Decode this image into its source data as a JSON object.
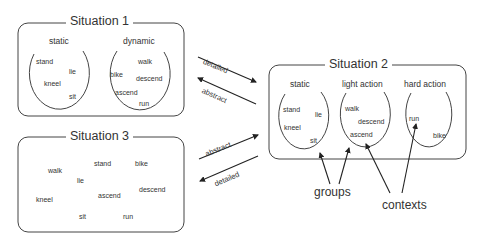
{
  "situation1": {
    "title": "Situation 1",
    "groups": [
      {
        "label": "static",
        "items": [
          "stand",
          "lie",
          "kneel",
          "sit"
        ]
      },
      {
        "label": "dynamic",
        "items": [
          "walk",
          "bike",
          "descend",
          "ascend",
          "run"
        ]
      }
    ]
  },
  "situation2": {
    "title": "Situation 2",
    "groups": [
      {
        "label": "static",
        "items": [
          "stand",
          "lie",
          "kneel",
          "sit"
        ]
      },
      {
        "label": "light action",
        "items": [
          "walk",
          "descend",
          "ascend"
        ]
      },
      {
        "label": "hard action",
        "items": [
          "run",
          "bike"
        ]
      }
    ]
  },
  "situation3": {
    "title": "Situation 3",
    "items": [
      "walk",
      "stand",
      "bike",
      "lie",
      "descend",
      "kneel",
      "ascend",
      "sit",
      "run"
    ]
  },
  "arrows": {
    "s1_to_s2": "detailed",
    "s2_to_s1": "abstract",
    "s3_to_s2": "abstract",
    "s2_to_s3": "detailed"
  },
  "annotations": {
    "groups": "groups",
    "contexts": "contexts"
  }
}
